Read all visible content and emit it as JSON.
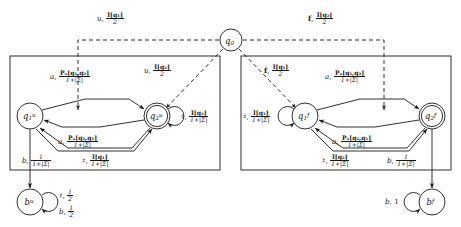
{
  "figure": {
    "kind": "probabilistic-automaton-state-diagram"
  },
  "nodes": [
    {
      "id": "q0",
      "label_base": "q",
      "sub": "0",
      "sup": "",
      "cx": 231,
      "cy": 40,
      "r": 11,
      "double": false
    },
    {
      "id": "q1u",
      "label_base": "q",
      "sub": "1",
      "sup": "u",
      "cx": 30,
      "cy": 116,
      "r": 13,
      "double": false
    },
    {
      "id": "q2u",
      "label_base": "q",
      "sub": "2",
      "sup": "u",
      "cx": 157,
      "cy": 116,
      "r": 13,
      "double": true
    },
    {
      "id": "q1f",
      "label_base": "q",
      "sub": "1",
      "sup": "f",
      "cx": 305,
      "cy": 116,
      "r": 13,
      "double": false
    },
    {
      "id": "q2f",
      "label_base": "q",
      "sub": "2",
      "sup": "f",
      "cx": 432,
      "cy": 116,
      "r": 13,
      "double": true
    },
    {
      "id": "bu",
      "label_base": "b",
      "sub": "",
      "sup": "u",
      "cx": 30,
      "cy": 202,
      "r": 13,
      "double": false
    },
    {
      "id": "bf",
      "label_base": "b",
      "sub": "",
      "sup": "f",
      "cx": 432,
      "cy": 202,
      "r": 13,
      "double": false
    }
  ],
  "boxes": [
    {
      "id": "box-u",
      "x": 10,
      "y": 56,
      "w": 210,
      "h": 114
    },
    {
      "id": "box-f",
      "x": 241,
      "y": 56,
      "w": 210,
      "h": 114
    }
  ],
  "labels": {
    "top_left": {
      "symbol": "u",
      "weight_num": "I[q₁]",
      "weight_den": "2"
    },
    "top_right": {
      "symbol": "f",
      "weight_num": "I[q₂]",
      "weight_den": "2"
    },
    "diag_left": {
      "symbol": "u",
      "weight_num": "I[q₂]",
      "weight_den": "2"
    },
    "diag_right": {
      "symbol": "f",
      "weight_num": "I[q₁]",
      "weight_den": "2"
    },
    "a_top_left": {
      "symbol": "a",
      "weight_num": "Pₐ[q₁,q₂]",
      "weight_den": "1+|Σ|"
    },
    "a_bot_left": {
      "symbol": "a",
      "weight_num": "Pₐ[q₂,q₁]",
      "weight_den": "1+|Σ|"
    },
    "a_top_right": {
      "symbol": "a",
      "weight_num": "Pₐ[q₁,q₂]",
      "weight_den": "1+|Σ|"
    },
    "a_bot_right": {
      "symbol": "a",
      "weight_num": "Pₐ[q₂,q₁]",
      "weight_den": "1+|Σ|"
    },
    "loop_q2u": {
      "symbol": "♯",
      "weight_num": "I[q₂]",
      "weight_den": "1+|Σ|"
    },
    "loop_q1f": {
      "symbol": "♯",
      "weight_num": "I[q₁]",
      "weight_den": "1+|Σ|"
    },
    "b_left": {
      "symbol": "b",
      "weight_num": "1",
      "weight_den": "1+|Σ|"
    },
    "sharp_left": {
      "symbol": "♯",
      "weight_num": "I[q₁]",
      "weight_den": "1+|Σ|"
    },
    "sharp_right": {
      "symbol": "♯",
      "weight_num": "I[q₂]",
      "weight_den": "1+|Σ|"
    },
    "b_right": {
      "symbol": "b",
      "weight_num": "1",
      "weight_den": "1+|Σ|"
    },
    "bu_loop_sharp": {
      "symbol": "♯",
      "weight_num": "1",
      "weight_den": "2"
    },
    "bu_loop_b": {
      "symbol": "b",
      "weight_num": "1",
      "weight_den": "2"
    },
    "bf_loop_b": {
      "symbol": "b",
      "weight_plain": "1"
    }
  },
  "colors": {
    "ink": "#1a1a1a",
    "background": "#ffffff"
  }
}
